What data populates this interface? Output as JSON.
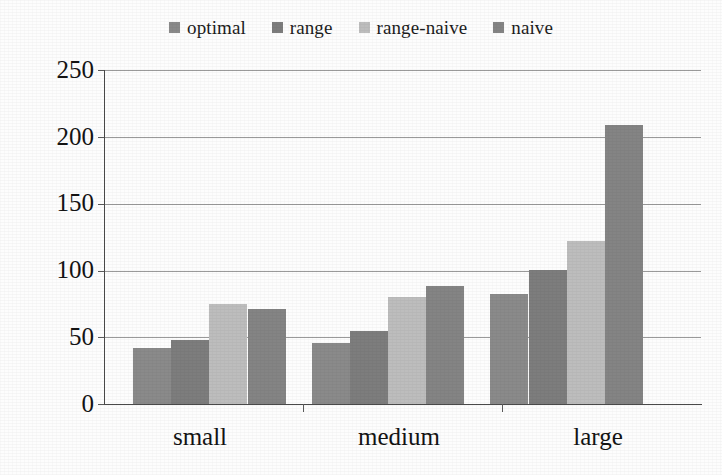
{
  "chart_data": {
    "type": "bar",
    "title": "",
    "subtitle": "",
    "xlabel": "",
    "ylabel": "",
    "categories": [
      "small",
      "medium",
      "large"
    ],
    "series": [
      {
        "name": "optimal",
        "color": "#8a8a8a",
        "values": [
          42,
          46,
          82
        ]
      },
      {
        "name": "range",
        "color": "#7d7d7d",
        "values": [
          48,
          55,
          100
        ]
      },
      {
        "name": "range-naive",
        "color": "#bdbdbd",
        "values": [
          75,
          80,
          122
        ]
      },
      {
        "name": "naive",
        "color": "#848484",
        "values": [
          71,
          88,
          209
        ]
      }
    ],
    "ylim": [
      0,
      250
    ],
    "yticks": [
      0,
      50,
      100,
      150,
      200,
      250
    ],
    "ytick_labels": [
      "0",
      "50",
      "100",
      "150",
      "200",
      "250"
    ],
    "grid": true,
    "grid_axis": "y",
    "legend_position": "top-center",
    "bar_gap": 0,
    "group_gap": 26
  },
  "legend": {
    "items": [
      {
        "label": "optimal"
      },
      {
        "label": "range"
      },
      {
        "label": "range-naive"
      },
      {
        "label": "naive"
      }
    ]
  },
  "axes": {
    "y_ticks": [
      "250",
      "200",
      "150",
      "100",
      "50",
      "0"
    ],
    "x_categories": [
      "small",
      "medium",
      "large"
    ]
  }
}
